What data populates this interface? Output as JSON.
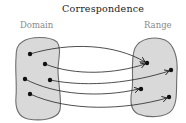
{
  "title": "Correspondence",
  "sets": {
    "domain": {
      "label": "Domain"
    },
    "range": {
      "label": "Range"
    }
  },
  "colors": {
    "set_fill": "#d9d9d9",
    "set_stroke": "#6e6e6e",
    "point": "#111111",
    "arrow": "#222222",
    "label": "#8a8a8a",
    "title": "#222222"
  },
  "domain_points": [
    {
      "id": "d1",
      "x": 30,
      "y": 54
    },
    {
      "id": "d2",
      "x": 45,
      "y": 64
    },
    {
      "id": "d3",
      "x": 25,
      "y": 79
    },
    {
      "id": "d4",
      "x": 50,
      "y": 80
    },
    {
      "id": "d5",
      "x": 30,
      "y": 94
    }
  ],
  "range_points": [
    {
      "id": "r1",
      "x": 147,
      "y": 63
    },
    {
      "id": "r2",
      "x": 171,
      "y": 70
    },
    {
      "id": "r3",
      "x": 141,
      "y": 89
    },
    {
      "id": "r4",
      "x": 169,
      "y": 97
    }
  ],
  "mappings": [
    {
      "from": "d1",
      "to": "r1"
    },
    {
      "from": "d2",
      "to": "r1"
    },
    {
      "from": "d4",
      "to": "r2"
    },
    {
      "from": "d3",
      "to": "r3"
    },
    {
      "from": "d5",
      "to": "r4"
    }
  ]
}
